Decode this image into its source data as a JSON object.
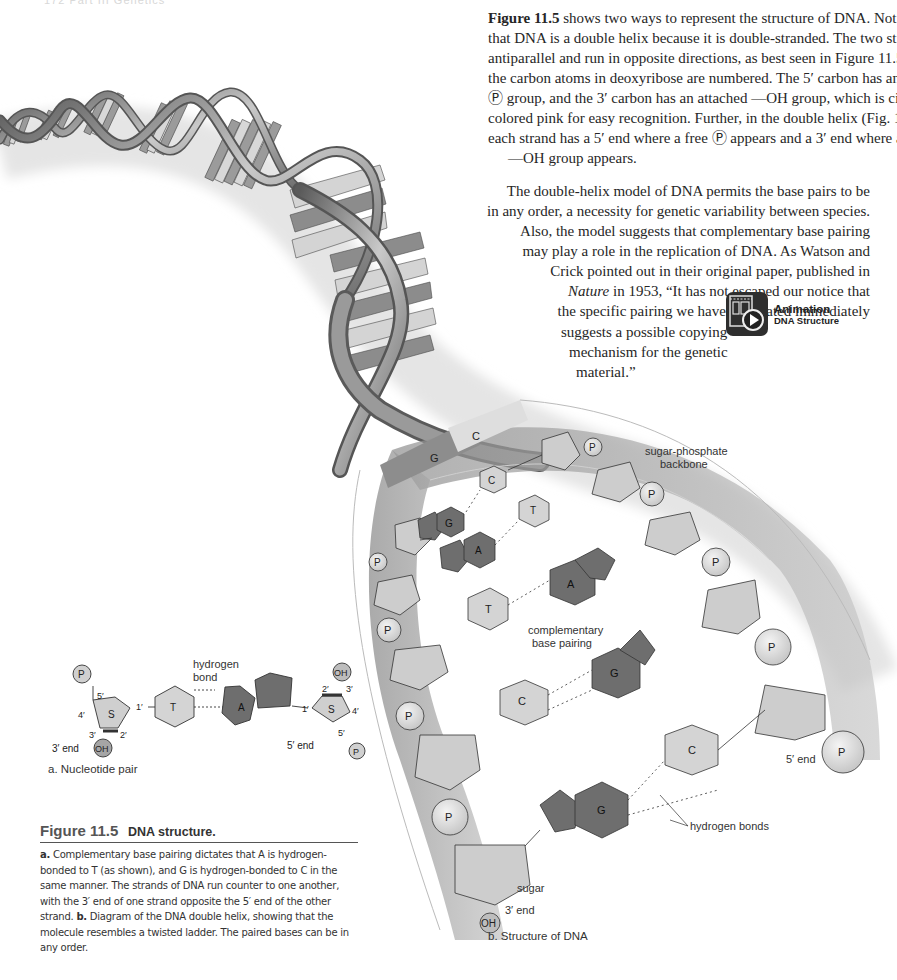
{
  "running_header": "172    Part III    Genetics",
  "body": {
    "para1": {
      "fig_ref": "Figure 11.5",
      "lines": [
        " shows two ways to represent the structure of DNA. Notice",
        "that DNA is a double helix because it is double-stranded. The two strands are",
        "antiparallel and run in opposite directions, as best seen in Figure 11.5a, where",
        "the carbon atoms in deoxyribose are numbered. The 5′ carbon has an attached",
        "Ⓟ group, and the 3′ carbon has an attached —OH group, which is circled and",
        "colored pink for easy recognition. Further, in the double helix (Fig. 11.5b),",
        "each strand has a 5′ end where a free Ⓟ appears and a 3′ end where a free",
        "—OH group appears."
      ]
    },
    "para2": {
      "lines": [
        "The double-helix model of DNA permits the base pairs to be",
        "in any order, a necessity for genetic variability between species.",
        "Also, the model suggests that complementary base pairing",
        "may play a role in the replication of DNA. As Watson and",
        "Crick pointed out in their original paper, published in",
        "in 1953, “It has not escaped our notice that",
        "the specific pairing we have postulated immediately",
        "suggests a possible copying",
        "mechanism for the genetic",
        "material.”"
      ],
      "journal": "Nature"
    }
  },
  "animation_badge": {
    "icon": "film-play-icon",
    "title": "Animation",
    "subtitle": "DNA Structure"
  },
  "figure_a": {
    "label": "a. Nucleotide pair",
    "hydrogen_bond_label": [
      "hydrogen",
      "bond"
    ],
    "left": {
      "phosphate": "P",
      "sugar": "S",
      "base": "T",
      "oh": "OH",
      "c5": "5′",
      "c4": "4′",
      "c3": "3′",
      "c2": "2′",
      "c1": "1′",
      "end": "3′ end"
    },
    "right": {
      "phosphate": "P",
      "sugar": "S",
      "base": "A",
      "oh": "OH",
      "c5": "5′",
      "c4": "4′",
      "c3": "3′",
      "c2": "2′",
      "c1": "1′",
      "end": "5′ end"
    }
  },
  "figure_b": {
    "label": "b. Structure of DNA",
    "labels": {
      "backbone": [
        "sugar-phosphate",
        "backbone"
      ],
      "pairing": [
        "complementary",
        "base pairing"
      ],
      "hbonds": "hydrogen bonds",
      "sugar": "sugar",
      "three_end": "3′ end",
      "five_end": "5′ end",
      "oh": "OH",
      "p": "P"
    },
    "ribbon_pair": [
      "G",
      "C"
    ],
    "base_pairs": [
      {
        "left": "G",
        "right": "C"
      },
      {
        "left": "A",
        "right": "T"
      },
      {
        "left": "T",
        "right": "A"
      },
      {
        "left": "C",
        "right": "G"
      },
      {
        "left": "G",
        "right": "C"
      }
    ]
  },
  "caption": {
    "figure_number": "Figure 11.5",
    "title": "DNA structure.",
    "a_marker": "a.",
    "a_text": " Complementary base pairing dictates that A is hydrogen-bonded to T (as shown), and G is hydrogen-bonded to C in the same manner. The strands of DNA run counter to one another, with the 3′ end of one strand opposite the 5′ end of the other strand. ",
    "b_marker": "b.",
    "b_text": " Diagram of the DNA double helix, showing that the molecule resembles a twisted ladder. The paired bases can be in any order."
  },
  "colors": {
    "purine": "#6e6e6e",
    "pyrimidine": "#cfcfcf",
    "sugar": "#cdcdcd",
    "backbone_band": "#9a9a9a",
    "ribbon": "#8a8a8a"
  }
}
